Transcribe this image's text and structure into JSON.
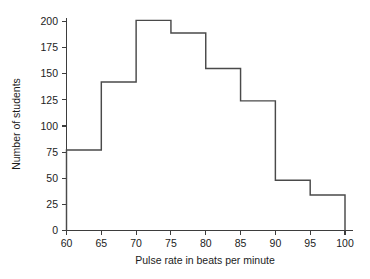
{
  "chart_data": {
    "type": "bar",
    "title": "",
    "subtitle": "",
    "xlabel": "Pulse rate in beats per minute",
    "ylabel": "Number of students",
    "categories": [
      "60-65",
      "65-70",
      "70-75",
      "75-80",
      "80-85",
      "85-90",
      "90-95",
      "95-100"
    ],
    "bin_edges": [
      60,
      65,
      70,
      75,
      80,
      85,
      90,
      95,
      100
    ],
    "values": [
      77,
      142,
      201,
      189,
      155,
      124,
      48,
      34
    ],
    "x": [
      60,
      65,
      70,
      75,
      80,
      85,
      90,
      95,
      100
    ],
    "xlim": [
      60,
      100
    ],
    "ylim": [
      0,
      210
    ],
    "xticks": [
      60,
      65,
      70,
      75,
      80,
      85,
      90,
      95,
      100
    ],
    "yticks": [
      0,
      25,
      50,
      75,
      100,
      125,
      150,
      175,
      200
    ],
    "xtick_labels": [
      "60",
      "65",
      "70",
      "75",
      "80",
      "85",
      "90",
      "95",
      "100"
    ],
    "ytick_labels": [
      "0",
      "25",
      "50",
      "75",
      "100",
      "125",
      "150",
      "175",
      "200"
    ],
    "grid": false,
    "legend": null,
    "legend_position": "none",
    "series": [
      {
        "name": "Number of students",
        "values": [
          77,
          142,
          201,
          189,
          155,
          124,
          48,
          34
        ]
      }
    ],
    "colors": {
      "outline": "#4a4a4a",
      "axis": "#3d3d3d",
      "text": "#1c1c1c",
      "background": "#ffffff",
      "fill": "none"
    }
  }
}
